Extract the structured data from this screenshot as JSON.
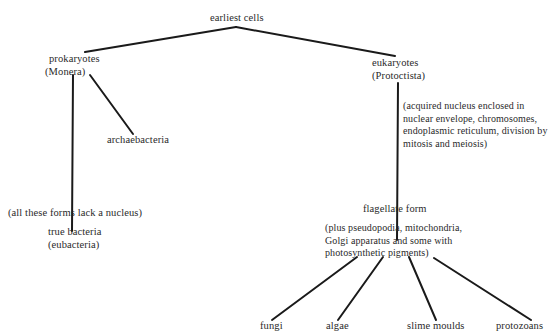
{
  "diagram": {
    "type": "tree",
    "root": {
      "label": "earliest cells"
    },
    "prokaryotes": {
      "line1": "prokaryotes",
      "line2": "(Monera)",
      "children": {
        "archaebacteria": "archaebacteria",
        "true_bacteria": {
          "line1": "true bacteria",
          "line2": "(eubacteria)"
        }
      },
      "note": "(all these forms lack a nucleus)"
    },
    "eukaryotes": {
      "line1": "eukaryotes",
      "line2": "(Protoctista)",
      "note": [
        "(acquired nucleus enclosed in",
        "nuclear envelope, chromosomes,",
        "endoplasmic reticulum, division by",
        "mitosis and meiosis)"
      ],
      "flagellate": {
        "label": "flagellate form",
        "note": [
          "(plus pseudopodia, mitochondria,",
          "Golgi apparatus and some with",
          "photosynthetic pigments)"
        ],
        "children": [
          "fungi",
          "algae",
          "slime moulds",
          "protozoans"
        ]
      }
    },
    "edges": [
      [
        "earliest cells",
        "prokaryotes (Monera)"
      ],
      [
        "earliest cells",
        "eukaryotes (Protoctista)"
      ],
      [
        "prokaryotes (Monera)",
        "true bacteria (eubacteria)"
      ],
      [
        "prokaryotes (Monera)",
        "archaebacteria"
      ],
      [
        "eukaryotes (Protoctista)",
        "flagellate form"
      ],
      [
        "flagellate form",
        "fungi"
      ],
      [
        "flagellate form",
        "algae"
      ],
      [
        "flagellate form",
        "slime moulds"
      ],
      [
        "flagellate form",
        "protozoans"
      ]
    ],
    "colors": {
      "line": "#1a1a1a",
      "text": "#2a2a2a",
      "background": "#ffffff"
    }
  }
}
